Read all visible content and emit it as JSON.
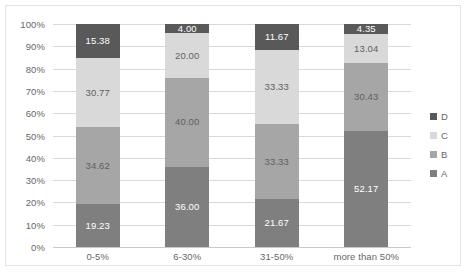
{
  "chart_data": {
    "type": "bar",
    "stacked": true,
    "stack_mode": "percent",
    "title": "",
    "xlabel": "",
    "ylabel": "",
    "ylim": [
      0,
      100
    ],
    "ytick_labels": [
      "0%",
      "10%",
      "20%",
      "30%",
      "40%",
      "50%",
      "60%",
      "70%",
      "80%",
      "90%",
      "100%"
    ],
    "ytick_values": [
      0,
      10,
      20,
      30,
      40,
      50,
      60,
      70,
      80,
      90,
      100
    ],
    "grid": true,
    "legend_position": "right",
    "categories": [
      "0-5%",
      "6-30%",
      "31-50%",
      "more than 50%"
    ],
    "series": [
      {
        "name": "A",
        "color": "#7f7f7f",
        "label_color": "light",
        "values": [
          19.23,
          36.0,
          21.67,
          52.17
        ],
        "labels": [
          "19.23",
          "36.00",
          "21.67",
          "52.17"
        ]
      },
      {
        "name": "B",
        "color": "#a6a6a6",
        "label_color": "dark",
        "values": [
          34.62,
          40.0,
          33.33,
          30.43
        ],
        "labels": [
          "34.62",
          "40.00",
          "33.33",
          "30.43"
        ]
      },
      {
        "name": "C",
        "color": "#d9d9d9",
        "label_color": "dark",
        "values": [
          30.77,
          20.0,
          33.33,
          13.04
        ],
        "labels": [
          "30.77",
          "20.00",
          "33.33",
          "13.04"
        ]
      },
      {
        "name": "D",
        "color": "#595959",
        "label_color": "light",
        "values": [
          15.38,
          4.0,
          11.67,
          4.35
        ],
        "labels": [
          "15.38",
          "4.00",
          "11.67",
          "4.35"
        ]
      }
    ],
    "legend_entries": [
      {
        "label": "D",
        "color": "#595959"
      },
      {
        "label": "C",
        "color": "#d9d9d9"
      },
      {
        "label": "B",
        "color": "#a6a6a6"
      },
      {
        "label": "A",
        "color": "#7f7f7f"
      }
    ]
  }
}
